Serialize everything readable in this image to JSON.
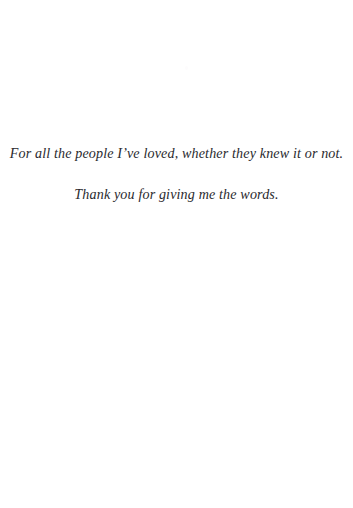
{
  "page": {
    "kind": "book-dedication-page",
    "background_color": "#ffffff",
    "ink_color": "#2a2a2e"
  },
  "dedication": {
    "lines": [
      "For all the people I’ve loved, whether they knew it or not.",
      "Thank you for giving me the words."
    ]
  }
}
